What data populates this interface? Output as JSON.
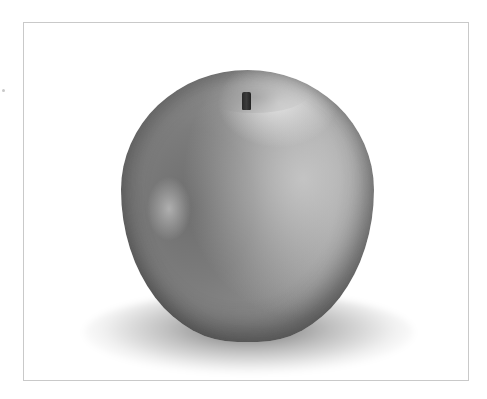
{
  "image": {
    "subject": "apple",
    "style": "black-and-white photograph",
    "background_color": "#ffffff",
    "frame_border_color": "#c9c9c9",
    "apple_tone_colors": [
      "#5a5a5a",
      "#7a7a7a",
      "#9a9a9a",
      "#b4b4b4"
    ],
    "stem_color": "#2a2a2a"
  }
}
